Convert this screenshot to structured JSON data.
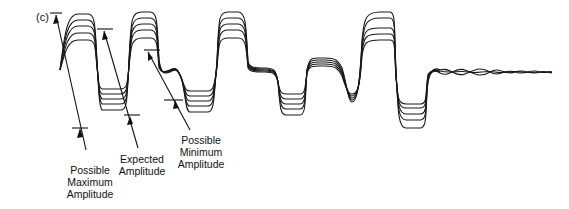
{
  "figure": {
    "panel_label": "(c)",
    "annotations": [
      {
        "id": "max",
        "lines": [
          "Possible",
          "Maximum",
          "Amplitude"
        ]
      },
      {
        "id": "expected",
        "lines": [
          "Expected",
          "Amplitude"
        ]
      },
      {
        "id": "min",
        "lines": [
          "Possible",
          "Minimum",
          "Amplitude"
        ]
      }
    ],
    "trace_count": 5,
    "colors": {
      "line": "#1a1a1a",
      "background": "#ffffff"
    }
  }
}
